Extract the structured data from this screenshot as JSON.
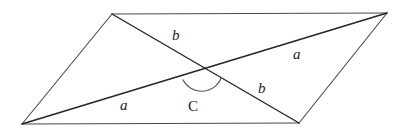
{
  "figure": {
    "kind": "geometry-diagram",
    "canvas": {
      "width": 398,
      "height": 131
    },
    "background_color": "#ffffff",
    "stroke_color_edges": "#4a4a4a",
    "stroke_color_diagonals": "#242424",
    "stroke_color_arc": "#5a5a5a",
    "label_color": "#1c1c1c",
    "vertices": {
      "top_left": {
        "x": 112,
        "y": 14
      },
      "top_right": {
        "x": 387,
        "y": 13
      },
      "bottom_right": {
        "x": 299,
        "y": 123
      },
      "bottom_left": {
        "x": 22,
        "y": 124
      },
      "intersection": {
        "x": 202,
        "y": 71
      }
    },
    "edges": [
      {
        "name": "top-edge",
        "from": "top_left",
        "to": "top_right",
        "path": "M 112 14 L 387 13"
      },
      {
        "name": "right-edge",
        "from": "top_right",
        "to": "bottom_right",
        "path": "M 387 13 L 299 123"
      },
      {
        "name": "bottom-edge",
        "from": "bottom_right",
        "to": "bottom_left",
        "path": "M 299 123 L 22 124"
      },
      {
        "name": "left-edge",
        "from": "bottom_left",
        "to": "top_left",
        "path": "M 22 124 L 112 14"
      }
    ],
    "diagonals": [
      {
        "name": "diagonal-a",
        "from": "bottom_left",
        "to": "top_right",
        "path": "M 22 124 L 387 13",
        "label": "a"
      },
      {
        "name": "diagonal-b",
        "from": "top_left",
        "to": "bottom_right",
        "path": "M 112 14 L 299 123",
        "label": "b"
      }
    ],
    "angle_arc": {
      "name": "angle-arc-C",
      "center": {
        "x": 202,
        "y": 71
      },
      "radius": 21,
      "path": "M 182.9 79.8 A 21 21 0 0 0 221.3 77.5",
      "label": "C"
    },
    "labels": [
      {
        "id": "label-b-top",
        "text": "b",
        "x": 172,
        "y": 28,
        "style": "italic"
      },
      {
        "id": "label-a-right",
        "text": "a",
        "x": 293,
        "y": 47,
        "style": "italic"
      },
      {
        "id": "label-b-bottom",
        "text": "b",
        "x": 258,
        "y": 81,
        "style": "italic"
      },
      {
        "id": "label-a-left",
        "text": "a",
        "x": 120,
        "y": 98,
        "style": "italic"
      },
      {
        "id": "label-C-angle",
        "text": "C",
        "x": 188,
        "y": 99,
        "style": "upright"
      }
    ]
  }
}
